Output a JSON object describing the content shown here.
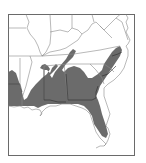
{
  "map": {
    "subject": "Southeastern United States range map",
    "colors": {
      "background": "#ffffff",
      "frame": "#6a6a6a",
      "state_lines": "#8a8a8a",
      "range_fill": "#6b6b6b",
      "range_borders": "#2e2e2e"
    },
    "legend": [],
    "labels": []
  }
}
